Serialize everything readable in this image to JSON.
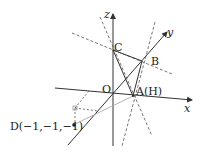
{
  "figure": {
    "type": "3d-coordinate-diagram",
    "axes": {
      "x_label": "x",
      "y_label": "y",
      "z_label": "z"
    },
    "points": {
      "origin": "O",
      "a": "A(H)",
      "b": "B",
      "c": "C",
      "d": "D(−1,−1,−1)"
    },
    "colors": {
      "line": "#333333",
      "dashed": "#555555",
      "light": "#aaaaaa"
    }
  }
}
